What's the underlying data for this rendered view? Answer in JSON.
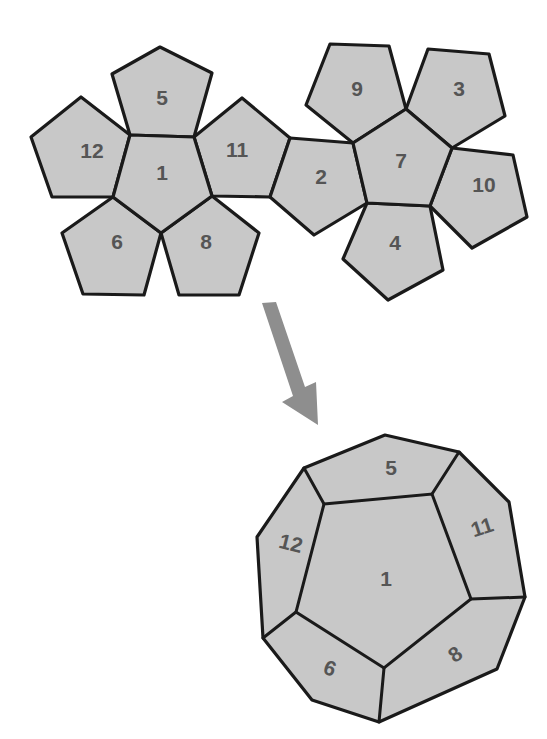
{
  "diagram": {
    "title": "",
    "colors": {
      "face_fill": "#c8c8c8",
      "edge_stroke": "#1a1a1a",
      "label_color": "#555555",
      "arrow_fill": "#8e8e8e",
      "background": "#ffffff"
    },
    "net": {
      "faces": [
        {
          "id": "1",
          "label": "1"
        },
        {
          "id": "5",
          "label": "5"
        },
        {
          "id": "12",
          "label": "12"
        },
        {
          "id": "11",
          "label": "11"
        },
        {
          "id": "6",
          "label": "6"
        },
        {
          "id": "8",
          "label": "8"
        },
        {
          "id": "2",
          "label": "2"
        },
        {
          "id": "7",
          "label": "7"
        },
        {
          "id": "9",
          "label": "9"
        },
        {
          "id": "3",
          "label": "3"
        },
        {
          "id": "10",
          "label": "10"
        },
        {
          "id": "4",
          "label": "4"
        }
      ]
    },
    "arrow": {
      "direction": "down-right",
      "meaning": "folds into"
    },
    "solid": {
      "visible_faces": [
        {
          "id": "1",
          "label": "1"
        },
        {
          "id": "5",
          "label": "5"
        },
        {
          "id": "12",
          "label": "12"
        },
        {
          "id": "11",
          "label": "11"
        },
        {
          "id": "6",
          "label": "6"
        },
        {
          "id": "8",
          "label": "8"
        }
      ]
    }
  }
}
